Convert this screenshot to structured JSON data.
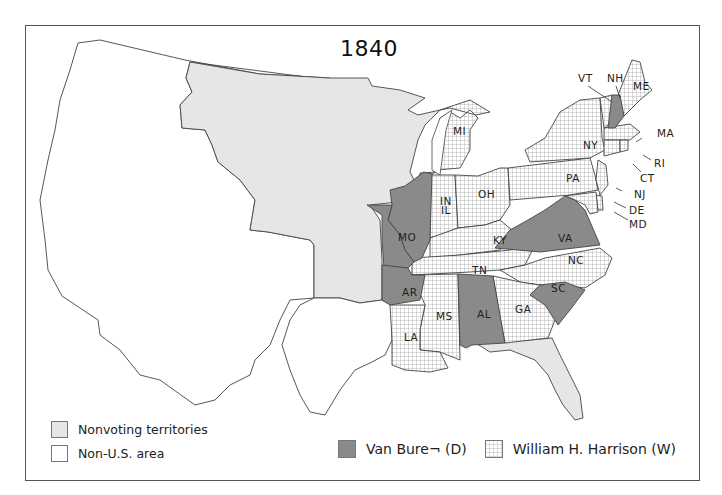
{
  "title": "1840",
  "colors": {
    "van_buren": "#8a8a8a",
    "harrison_bg": "#ffffff",
    "harrison_grid": "#9a9a9a",
    "nonvoting": "#e6e6e6",
    "non_us": "#ffffff",
    "border": "#444444"
  },
  "legend": {
    "nonvoting_label": "Nonvoting territories",
    "non_us_label": "Non-U.S. area",
    "van_buren_label": "Van Bure¬ (D)",
    "harrison_label": "William H. Harrison (W)"
  },
  "states": {
    "ME": {
      "label": "ME",
      "winner": "Harrison"
    },
    "NH": {
      "label": "NH",
      "winner": "Van Buren"
    },
    "VT": {
      "label": "VT",
      "winner": "Harrison"
    },
    "MA": {
      "label": "MA",
      "winner": "Harrison"
    },
    "RI": {
      "label": "RI",
      "winner": "Harrison"
    },
    "CT": {
      "label": "CT",
      "winner": "Harrison"
    },
    "NY": {
      "label": "NY",
      "winner": "Harrison"
    },
    "NJ": {
      "label": "NJ",
      "winner": "Harrison"
    },
    "PA": {
      "label": "PA",
      "winner": "Harrison"
    },
    "DE": {
      "label": "DE",
      "winner": "Harrison"
    },
    "MD": {
      "label": "MD",
      "winner": "Harrison"
    },
    "VA": {
      "label": "VA",
      "winner": "Van Buren"
    },
    "NC": {
      "label": "NC",
      "winner": "Harrison"
    },
    "SC": {
      "label": "SC",
      "winner": "Van Buren"
    },
    "GA": {
      "label": "GA",
      "winner": "Harrison"
    },
    "AL": {
      "label": "AL",
      "winner": "Van Buren"
    },
    "MS": {
      "label": "MS",
      "winner": "Harrison"
    },
    "LA": {
      "label": "LA",
      "winner": "Harrison"
    },
    "AR": {
      "label": "AR",
      "winner": "Van Buren"
    },
    "TN": {
      "label": "TN",
      "winner": "Harrison"
    },
    "KY": {
      "label": "KY",
      "winner": "Harrison"
    },
    "OH": {
      "label": "OH",
      "winner": "Harrison"
    },
    "IN": {
      "label": "IN",
      "winner": "Harrison"
    },
    "IL": {
      "label": "IL",
      "winner": "Van Buren"
    },
    "MO": {
      "label": "MO",
      "winner": "Van Buren"
    },
    "MI": {
      "label": "MI",
      "winner": "Harrison"
    }
  }
}
